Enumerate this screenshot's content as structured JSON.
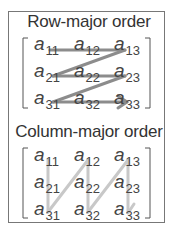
{
  "row_major": {
    "title": "Row-major order",
    "elements": [
      {
        "base": "a",
        "sub": "11"
      },
      {
        "base": "a",
        "sub": "12"
      },
      {
        "base": "a",
        "sub": "13"
      },
      {
        "base": "a",
        "sub": "21"
      },
      {
        "base": "a",
        "sub": "22"
      },
      {
        "base": "a",
        "sub": "23"
      },
      {
        "base": "a",
        "sub": "31"
      },
      {
        "base": "a",
        "sub": "32"
      },
      {
        "base": "a",
        "sub": "33"
      }
    ],
    "arrow_color": "#8c8c8c"
  },
  "column_major": {
    "title": "Column-major order",
    "elements": [
      {
        "base": "a",
        "sub": "11"
      },
      {
        "base": "a",
        "sub": "12"
      },
      {
        "base": "a",
        "sub": "13"
      },
      {
        "base": "a",
        "sub": "21"
      },
      {
        "base": "a",
        "sub": "22"
      },
      {
        "base": "a",
        "sub": "23"
      },
      {
        "base": "a",
        "sub": "31"
      },
      {
        "base": "a",
        "sub": "32"
      },
      {
        "base": "a",
        "sub": "33"
      }
    ],
    "arrow_color": "#c8c8c8"
  }
}
